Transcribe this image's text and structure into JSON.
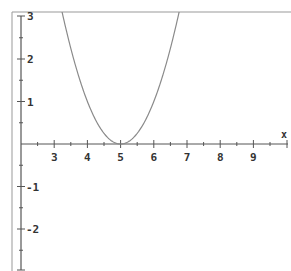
{
  "chart_data": {
    "type": "line",
    "title": "",
    "xlabel": "x",
    "ylabel": "",
    "xlim": [
      2,
      10
    ],
    "ylim": [
      -3,
      3
    ],
    "grid": false,
    "legend": null,
    "x_ticks": [
      3,
      4,
      5,
      6,
      7,
      8,
      9
    ],
    "y_ticks": [
      3,
      2,
      1,
      -1,
      -2
    ],
    "series": [
      {
        "name": "y = (x-5)^2",
        "expression": "(x-5)^2",
        "x": [
          3.25,
          3.5,
          3.75,
          4.0,
          4.25,
          4.5,
          4.75,
          5.0,
          5.25,
          5.5,
          5.75,
          6.0,
          6.25,
          6.5,
          6.75
        ],
        "values": [
          3.06,
          2.25,
          1.56,
          1.0,
          0.56,
          0.25,
          0.06,
          0.0,
          0.06,
          0.25,
          0.56,
          1.0,
          1.56,
          2.25,
          3.06
        ],
        "color": "#808080"
      }
    ]
  },
  "axes": {
    "x_label": "x",
    "x_tick_labels": [
      "3",
      "4",
      "5",
      "6",
      "7",
      "8",
      "9"
    ],
    "y_tick_labels": [
      "3",
      "2",
      "1",
      "-1",
      "-2"
    ]
  },
  "colors": {
    "axis": "#555555",
    "border": "#888888",
    "curve": "#8a8a8a",
    "text": "#333333"
  }
}
